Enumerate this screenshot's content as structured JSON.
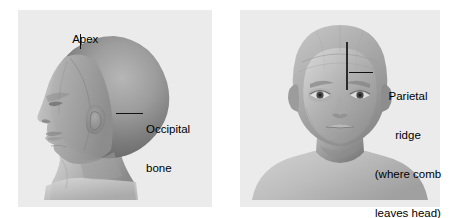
{
  "figure": {
    "background_color": "#ffffff",
    "panel_background_color": "#ebebeb",
    "label_color": "#000000",
    "leader_line_color": "#111111",
    "comb_line_color": "#2b2b2b",
    "skin_tone": "#9a9a9a"
  },
  "panels": [
    {
      "id": "left",
      "view": "lateral-profile-head",
      "description": "Shaded grayscale illustration of a bald human head in left-facing side profile, including neck and upper shoulders.",
      "labels": [
        {
          "name": "apex",
          "text": "Apex",
          "leader": "vertical"
        },
        {
          "name": "occipital-bone",
          "line1": "Occipital",
          "line2": "bone",
          "leader": "horizontal"
        }
      ]
    },
    {
      "id": "right",
      "view": "frontal-head",
      "description": "Shaded grayscale illustration of a bald human head seen from the front, including neck and shoulders, with a vertical comb line resting against the side of the skull.",
      "annotations": [
        {
          "name": "comb-line",
          "kind": "vertical-line"
        }
      ],
      "labels": [
        {
          "name": "parietal-ridge",
          "line1": "Parietal",
          "line2": "ridge",
          "line3": "(where comb",
          "line4": "leaves head)",
          "leader": "horizontal"
        }
      ]
    }
  ]
}
